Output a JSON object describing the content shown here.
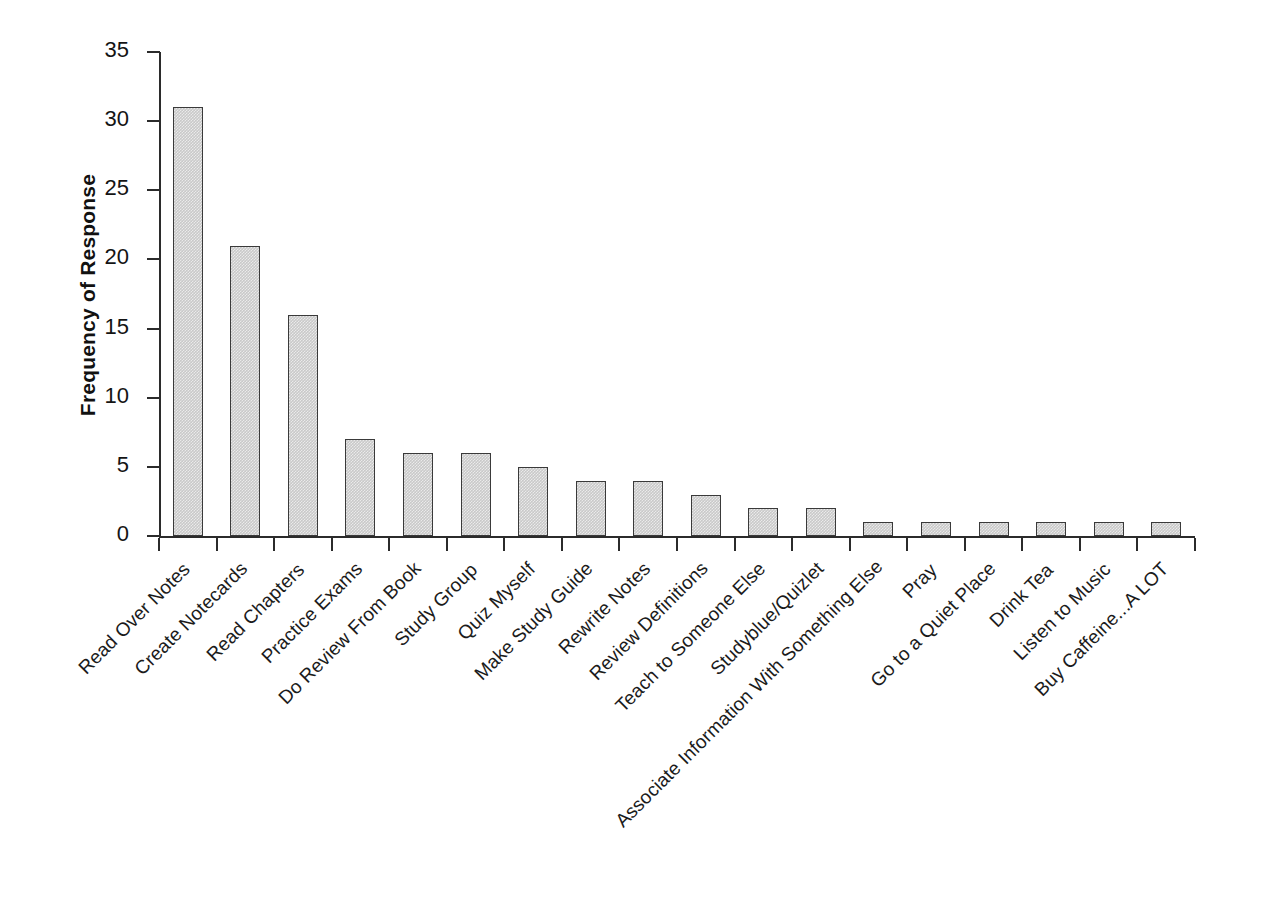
{
  "chart_data": {
    "type": "bar",
    "title": "",
    "xlabel": "",
    "ylabel": "Frequency of Response",
    "ylim": [
      0,
      35
    ],
    "ytick_values": [
      0,
      5,
      10,
      15,
      20,
      25,
      30,
      35
    ],
    "ytick_labels": [
      "0",
      "5",
      "10",
      "15",
      "20",
      "25",
      "30",
      "35"
    ],
    "grid": false,
    "legend": false,
    "bar_fill_color": "#c9c9c9",
    "bar_edge_color": "#3a3a3a",
    "background_color": "#ffffff",
    "axis_color": "#2b2b2b",
    "categories": [
      "Read Over Notes",
      "Create Notecards",
      "Read Chapters",
      "Practice Exams",
      "Do Review From Book",
      "Study Group",
      "Quiz Myself",
      "Make Study Guide",
      "Rewrite Notes",
      "Review Definitions",
      "Teach to Someone Else",
      "Studyblue/Quizlet",
      "Associate Information With Something Else",
      "Pray",
      "Go to a Quiet Place",
      "Drink Tea",
      "Listen to Music",
      "Buy Caffeine...A LOT"
    ],
    "values": [
      31,
      21,
      16,
      7,
      6,
      6,
      5,
      4,
      4,
      3,
      2,
      2,
      1,
      1,
      1,
      1,
      1,
      1
    ]
  }
}
